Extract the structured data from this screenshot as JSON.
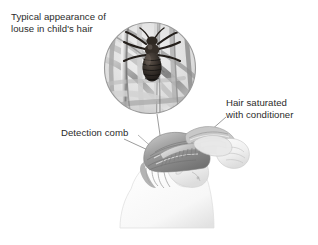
{
  "figure": {
    "type": "medical-illustration",
    "background_color": "#ffffff",
    "text_color": "#2b2b2b",
    "leader_line_color": "#8a8a8a"
  },
  "labels": {
    "louse": {
      "line1": "Typical appearance of",
      "line2": "louse in child's hair"
    },
    "hair": {
      "line1": "Hair saturated",
      "line2": "with conditioner"
    },
    "comb": {
      "line1": "Detection comb"
    }
  },
  "magnifier": {
    "name": "magnified-louse-circle",
    "center_x": 150,
    "center_y": 68,
    "radius": 46,
    "contents": "head louse gripping hair shafts",
    "border_color": "#9a9a9a"
  },
  "scene": {
    "name": "child-head-being-combed",
    "elements": [
      "child head in profile leaning forward",
      "hand holding detection comb",
      "hand holding hair saturated with conditioner",
      "shoulder and back"
    ]
  },
  "leader_lines": [
    {
      "name": "louse-leader",
      "from_x": 157,
      "from_y": 124,
      "to_x": 163,
      "to_y": 156
    },
    {
      "name": "hair-leader",
      "from_x": 224,
      "from_y": 118,
      "to_x": 186,
      "to_y": 152
    },
    {
      "name": "comb-leader",
      "from_x": 124,
      "from_y": 139,
      "to_x": 162,
      "to_y": 157
    }
  ]
}
